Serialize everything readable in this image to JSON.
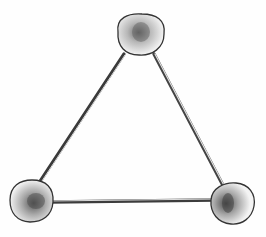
{
  "image": {
    "description": "Pencil sketch of a triangle built from three sticks joined by three round balls (marshmallow/clay style model)",
    "style": "graphite pencil drawing",
    "background": "#ffffff"
  },
  "nodes": [
    {
      "id": "top",
      "cx": 140,
      "cy": 35,
      "rx": 24,
      "ry": 20
    },
    {
      "id": "bottom-left",
      "cx": 30,
      "cy": 201,
      "rx": 22,
      "ry": 21
    },
    {
      "id": "bottom-right",
      "cx": 231,
      "cy": 203,
      "rx": 21,
      "ry": 21
    }
  ],
  "edges": [
    {
      "from": "top",
      "to": "bottom-left"
    },
    {
      "from": "top",
      "to": "bottom-right"
    },
    {
      "from": "bottom-left",
      "to": "bottom-right"
    }
  ],
  "caption": "Triangle model: three sticks connected by three balls"
}
